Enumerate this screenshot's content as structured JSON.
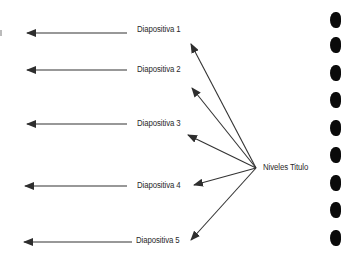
{
  "diagram": {
    "source_node": {
      "label": "Niveles Titulo",
      "x": 263,
      "y": 162,
      "anchor": [
        256,
        168
      ]
    },
    "slides": [
      {
        "label": "Diapositiva 1",
        "label_x": 137,
        "label_y": 24,
        "left_arrow": {
          "y": 33,
          "x1": 127,
          "x2": 27
        },
        "branch_tip": [
          191,
          44
        ]
      },
      {
        "label": "Diapositiva 2",
        "label_x": 137,
        "label_y": 64,
        "left_arrow": {
          "y": 70,
          "x1": 127,
          "x2": 27
        },
        "branch_tip": [
          192,
          88
        ]
      },
      {
        "label": "Diapositiva 3",
        "label_x": 137,
        "label_y": 118,
        "left_arrow": {
          "y": 124,
          "x1": 127,
          "x2": 27
        },
        "branch_tip": [
          188,
          135
        ]
      },
      {
        "label": "Diapositiva 4",
        "label_x": 137,
        "label_y": 180,
        "left_arrow": {
          "y": 186,
          "x1": 127,
          "x2": 25
        },
        "branch_tip": [
          194,
          185
        ]
      },
      {
        "label": "Diapositiva 5",
        "label_x": 136,
        "label_y": 235,
        "left_arrow": {
          "y": 242,
          "x1": 132,
          "x2": 24
        },
        "branch_tip": [
          191,
          240
        ]
      }
    ],
    "binder_holes_y": [
      20,
      45,
      73,
      100,
      128,
      155,
      183,
      210,
      238
    ],
    "colors": {
      "line": "#333333",
      "text": "#2a2a2a",
      "holes": "#0a0a0a"
    }
  }
}
